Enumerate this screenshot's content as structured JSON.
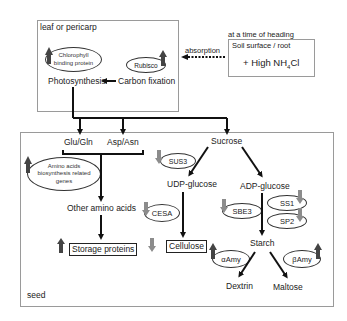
{
  "leaf_box": {
    "title": "leaf or pericarp",
    "chlorophyll": "Chlorophyll binding protein",
    "chlorophyll_l1": "Chlorophyll",
    "chlorophyll_l2": "binding protein",
    "rubisco": "Rubisco",
    "photosynthesis": "Photosynthesis",
    "carbon_fixation": "Carbon fixation"
  },
  "soil_box": {
    "caption": "at a time of heading",
    "title": "Soil surface / root",
    "treatment_prefix": "+ High NH",
    "treatment_sub": "4",
    "treatment_suffix": "Cl"
  },
  "absorption_label": "absorption",
  "seed_box": {
    "title": "seed",
    "glu_gln": "Glu/Gln",
    "asp_asn": "Asp/Asn",
    "amino_genes_l1": "Amino acids",
    "amino_genes_l2": "biosynthesis related",
    "amino_genes_l3": "genes",
    "other_amino_acids": "Other amino acids",
    "storage_proteins": "Storage proteins",
    "sucrose": "Sucrose",
    "sus3": "SUS3",
    "udp_glucose": "UDP-glucose",
    "adp_glucose": "ADP-glucose",
    "cesa": "CESA",
    "cellulose": "Cellulose",
    "sbe3": "SBE3",
    "ss1": "SS1",
    "sp2": "SP2",
    "starch": "Starch",
    "alpha_amy": "αAmy",
    "beta_amy": "βAmy",
    "dextrin": "Dextrin",
    "maltose": "Maltose"
  },
  "colors": {
    "up_arrow": "#444444",
    "down_arrow": "#8c8c8c",
    "box_border": "#9a9a9a",
    "line": "#111111"
  }
}
